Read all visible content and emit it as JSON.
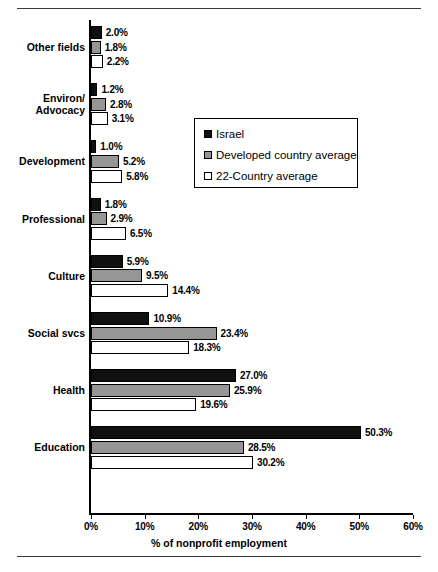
{
  "chart_data": {
    "type": "bar",
    "orientation": "horizontal",
    "title": "",
    "xlabel": "% of nonprofit employment",
    "ylabel": "",
    "xlim": [
      0,
      60
    ],
    "xticks": [
      "0%",
      "10%",
      "20%",
      "30%",
      "40%",
      "50%",
      "60%"
    ],
    "xtick_values": [
      0,
      10,
      20,
      30,
      40,
      50,
      60
    ],
    "grid": false,
    "legend_position": "upper right",
    "categories": [
      "Other fields",
      "Environ/\nAdvocacy",
      "Development",
      "Professional",
      "Culture",
      "Social svcs",
      "Health",
      "Education"
    ],
    "series": [
      {
        "name": "Israel",
        "color": "#101010",
        "values": [
          2.0,
          1.2,
          1.0,
          1.8,
          5.9,
          10.9,
          27.0,
          50.3
        ],
        "labels": [
          "2.0%",
          "1.2%",
          "1.0%",
          "1.8%",
          "5.9%",
          "10.9%",
          "27.0%",
          "50.3%"
        ]
      },
      {
        "name": "Developed country average",
        "color": "#969696",
        "values": [
          1.8,
          2.8,
          5.2,
          2.9,
          9.5,
          23.4,
          25.9,
          28.5
        ],
        "labels": [
          "1.8%",
          "2.8%",
          "5.2%",
          "2.9%",
          "9.5%",
          "23.4%",
          "25.9%",
          "28.5%"
        ]
      },
      {
        "name": "22-Country average",
        "color": "#ffffff",
        "values": [
          2.2,
          3.1,
          5.8,
          6.5,
          14.4,
          18.3,
          19.6,
          30.2
        ],
        "labels": [
          "2.2%",
          "3.1%",
          "5.8%",
          "6.5%",
          "14.4%",
          "18.3%",
          "19.6%",
          "30.2%"
        ]
      }
    ]
  },
  "legend": {
    "items": [
      {
        "label": "Israel",
        "color": "#101010"
      },
      {
        "label": "Developed country average",
        "color": "#969696"
      },
      {
        "label": "22-Country average",
        "color": "#ffffff"
      }
    ]
  },
  "axis": {
    "x_axis_label": "% of nonprofit employment"
  }
}
